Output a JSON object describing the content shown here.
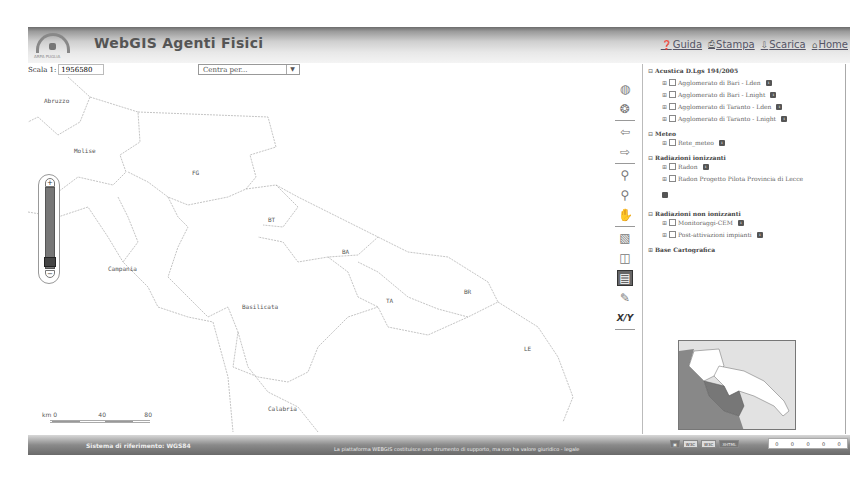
{
  "header": {
    "logo_text": "ARPA PUGLIA",
    "title": "WebGIS Agenti Fisici",
    "links": [
      {
        "label": "Guida",
        "icon": "help-icon"
      },
      {
        "label": "Stampa",
        "icon": "print-icon"
      },
      {
        "label": "Scarica",
        "icon": "download-icon"
      },
      {
        "label": "Home",
        "icon": "home-icon"
      }
    ]
  },
  "toolbar": {
    "scale_label": "Scala 1:",
    "scale_value": "1956580",
    "center_select": "Centra per..."
  },
  "map": {
    "labels": [
      {
        "text": "Abruzzo",
        "x": 16,
        "y": 20
      },
      {
        "text": "Molise",
        "x": 46,
        "y": 70
      },
      {
        "text": "FG",
        "x": 164,
        "y": 92
      },
      {
        "text": "BT",
        "x": 240,
        "y": 139
      },
      {
        "text": "BA",
        "x": 314,
        "y": 171
      },
      {
        "text": "Campania",
        "x": 80,
        "y": 188
      },
      {
        "text": "Basilicata",
        "x": 214,
        "y": 226
      },
      {
        "text": "TA",
        "x": 358,
        "y": 220
      },
      {
        "text": "BR",
        "x": 436,
        "y": 211
      },
      {
        "text": "LE",
        "x": 496,
        "y": 268
      },
      {
        "text": "Calabria",
        "x": 240,
        "y": 328
      }
    ],
    "scalebar": {
      "unit": "km",
      "ticks": [
        "0",
        "40",
        "80"
      ]
    }
  },
  "tools": [
    {
      "name": "full-extent-icon",
      "glyph": "◍"
    },
    {
      "name": "globe-icon",
      "glyph": "❂"
    },
    {
      "name": "previous-extent-icon",
      "glyph": "⇦"
    },
    {
      "name": "next-extent-icon",
      "glyph": "⇨"
    },
    {
      "name": "zoom-in-icon",
      "glyph": "⚲"
    },
    {
      "name": "zoom-out-icon",
      "glyph": "⚲"
    },
    {
      "name": "pan-icon",
      "glyph": "✋"
    },
    {
      "name": "select-box-icon",
      "glyph": "▧"
    },
    {
      "name": "query-icon",
      "glyph": "◫"
    },
    {
      "name": "info-balloon-icon",
      "glyph": "💬"
    },
    {
      "name": "measure-icon",
      "glyph": "✎"
    },
    {
      "name": "xy-icon",
      "glyph": "X/Y"
    }
  ],
  "layers": {
    "groups": [
      {
        "label": "Acustica D.Lgs 194/2005",
        "items": [
          "Agglomerato di Bari - Lden",
          "Agglomerato di Bari - Lnight",
          "Agglomerato di Taranto - Lden",
          "Agglomerato di Taranto - Lnight"
        ]
      },
      {
        "label": "Meteo",
        "items": [
          "Rete_meteo"
        ]
      },
      {
        "label": "Radiazioni ionizzanti",
        "items": [
          "Radon",
          "Radon Progetto Pilota Provincia di Lecce"
        ]
      },
      {
        "label": "Radiazioni non ionizzanti",
        "items": [
          "Monitoraggi-CEM",
          "Post-attivazioni impianti"
        ]
      },
      {
        "label": "Base Cartografica",
        "items": []
      }
    ]
  },
  "footer": {
    "reference": "Sistema di riferimento: WGS84",
    "disclaimer": "La piattaforma WEBGIS costituisce uno strumento di supporto, ma non ha valore giuridico - legale",
    "coords": [
      "0",
      "0",
      "0",
      "0",
      "0"
    ]
  }
}
